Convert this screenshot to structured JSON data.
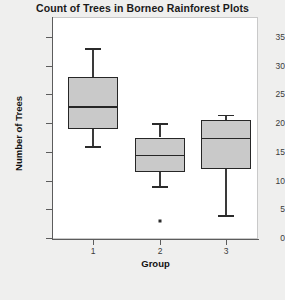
{
  "chart_data": {
    "type": "box",
    "title": "Count of Trees in Borneo Rainforest Plots",
    "xlabel": "Group",
    "ylabel": "Number of Trees",
    "ylim": [
      0,
      37
    ],
    "yticks": [
      0,
      5,
      10,
      15,
      20,
      25,
      30,
      35
    ],
    "ytick_labels": [
      "0",
      "5",
      "10",
      "15",
      "20",
      "25",
      "30",
      "35"
    ],
    "categories": [
      "1",
      "2",
      "3"
    ],
    "grid": false,
    "legend": null,
    "boxes": [
      {
        "group": "1",
        "whisker_low": 16,
        "q1": 19,
        "median": 23,
        "q3": 28,
        "whisker_high": 33,
        "outliers": []
      },
      {
        "group": "2",
        "whisker_low": 9,
        "q1": 11.5,
        "median": 14.5,
        "q3": 17.5,
        "whisker_high": 20,
        "outliers": [
          3
        ]
      },
      {
        "group": "3",
        "whisker_low": 4,
        "q1": 12,
        "median": 17.5,
        "q3": 20.5,
        "whisker_high": 21.5,
        "outliers": []
      }
    ],
    "colors": {
      "box_fill": "#c9c9c9",
      "box_edge": "#262626",
      "axis": "#5c5c5c",
      "text": "#1a1a1a",
      "plot_background": "#ffffff",
      "figure_background": "#efefee"
    }
  }
}
